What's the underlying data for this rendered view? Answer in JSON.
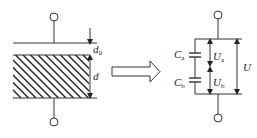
{
  "diagram": {
    "left_figure": {
      "description": "Parallel-plate capacitor with air gap and dielectric slab",
      "labels": {
        "gap": {
          "main": "d",
          "sub": "0"
        },
        "dielectric": {
          "main": "d",
          "sub": ""
        }
      }
    },
    "transform_arrow": {
      "label": ""
    },
    "right_figure": {
      "description": "Equivalent series capacitor circuit",
      "labels": {
        "cap_a": {
          "main": "C",
          "sub": "a"
        },
        "cap_b": {
          "main": "C",
          "sub": "b"
        },
        "volt_a": {
          "main": "U",
          "sub": "a"
        },
        "volt_b": {
          "main": "U",
          "sub": "b"
        },
        "volt_total": {
          "main": "U",
          "sub": ""
        }
      }
    },
    "colors": {
      "stroke": "#333333",
      "background": "#ffffff"
    }
  }
}
